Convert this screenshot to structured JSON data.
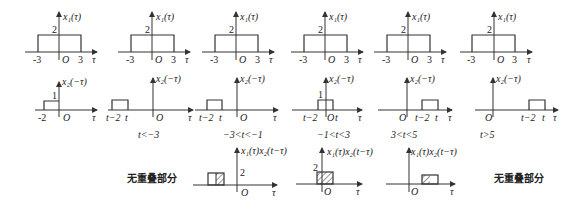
{
  "row1": {
    "ylabel": "x₁(τ)",
    "height_label": "2",
    "ticks": [
      "-3",
      "O",
      "3"
    ],
    "xlabel": "τ",
    "panels": [
      {
        "axis_x": 59
      },
      {
        "axis_x": 152
      },
      {
        "axis_x": 236
      },
      {
        "axis_x": 325
      },
      {
        "axis_x": 408
      },
      {
        "axis_x": 494
      }
    ]
  },
  "row2": {
    "ylabel": "x₂(−τ)",
    "xlabel": "τ",
    "origin": "O",
    "panels": [
      {
        "height_label": "1",
        "ticks": [
          "-2"
        ],
        "condition": ""
      },
      {
        "ticks": [
          "t−2",
          "t"
        ],
        "condition": "t<−3"
      },
      {
        "ticks": [
          "t−2",
          "t"
        ],
        "condition": "−3<t<−1"
      },
      {
        "height_label": "1",
        "ticks": [
          "t−2",
          "t"
        ],
        "condition": "−1<t<3"
      },
      {
        "ticks": [
          "t−2",
          "t"
        ],
        "condition": "3<t<5"
      },
      {
        "ticks": [
          "t−2",
          "t"
        ],
        "condition": "t>5"
      }
    ]
  },
  "row3": {
    "ylabel": "x₁(τ)x₂(t−τ)",
    "xlabel": "τ",
    "origin": "O",
    "no_overlap_left": "无重叠部分",
    "no_overlap_right": "无重叠部分",
    "panels": [
      {
        "height_label": "2"
      },
      {
        "height_label": "2"
      },
      {
        "height_label": ""
      }
    ]
  }
}
